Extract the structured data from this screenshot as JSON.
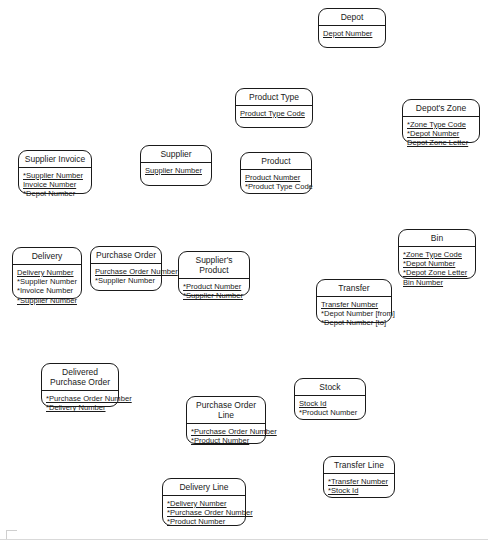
{
  "diagram": {
    "type": "entity-relationship-diagram",
    "width": 488,
    "height": 540,
    "notation": "Barker ERD: underline = primary key component, asterisk = foreign key",
    "entities": [
      {
        "id": "depot",
        "name": "Depot",
        "x": 318,
        "y": 8,
        "w": 68,
        "h": 40,
        "attributes": [
          {
            "text": "Depot Number",
            "pk": true,
            "fk": false
          }
        ]
      },
      {
        "id": "product-type",
        "name": "Product Type",
        "x": 235,
        "y": 88,
        "w": 78,
        "h": 40,
        "attributes": [
          {
            "text": "Product Type Code",
            "pk": true,
            "fk": false
          }
        ]
      },
      {
        "id": "depots-zone",
        "name": "Depot's Zone",
        "x": 402,
        "y": 99,
        "w": 78,
        "h": 44,
        "attributes": [
          {
            "text": "*Zone Type Code",
            "pk": true,
            "fk": true
          },
          {
            "text": "*Depot Number",
            "pk": true,
            "fk": true
          },
          {
            "text": "Depot Zone Letter",
            "pk": true,
            "fk": false
          }
        ]
      },
      {
        "id": "supplier-invoice",
        "name": "Supplier Invoice",
        "x": 18,
        "y": 150,
        "w": 74,
        "h": 44,
        "attributes": [
          {
            "text": "*Supplier Number",
            "pk": true,
            "fk": true
          },
          {
            "text": "Invoice Number",
            "pk": true,
            "fk": false
          },
          {
            "text": "*Depot Number",
            "pk": false,
            "fk": true
          }
        ]
      },
      {
        "id": "supplier",
        "name": "Supplier",
        "x": 140,
        "y": 145,
        "w": 72,
        "h": 41,
        "attributes": [
          {
            "text": "Supplier Number",
            "pk": true,
            "fk": false
          }
        ]
      },
      {
        "id": "product",
        "name": "Product",
        "x": 240,
        "y": 152,
        "w": 72,
        "h": 42,
        "attributes": [
          {
            "text": "Product Number",
            "pk": true,
            "fk": false
          },
          {
            "text": "*Product Type Code",
            "pk": false,
            "fk": true
          }
        ]
      },
      {
        "id": "bin",
        "name": "Bin",
        "x": 398,
        "y": 229,
        "w": 78,
        "h": 50,
        "attributes": [
          {
            "text": "*Zone Type Code",
            "pk": true,
            "fk": true
          },
          {
            "text": "*Depot Number",
            "pk": true,
            "fk": true
          },
          {
            "text": "*Depot Zone Letter",
            "pk": true,
            "fk": true
          },
          {
            "text": "Bin Number",
            "pk": true,
            "fk": false
          }
        ]
      },
      {
        "id": "delivery",
        "name": "Delivery",
        "x": 12,
        "y": 247,
        "w": 70,
        "h": 52,
        "attributes": [
          {
            "text": "Delivery Number",
            "pk": true,
            "fk": false
          },
          {
            "text": "*Supplier Number",
            "pk": false,
            "fk": true
          },
          {
            "text": "*Invoice Number",
            "pk": false,
            "fk": true
          },
          {
            "text": "*Supplier Number",
            "pk": true,
            "fk": true
          }
        ]
      },
      {
        "id": "purchase-order",
        "name": "Purchase Order",
        "x": 90,
        "y": 246,
        "w": 72,
        "h": 45,
        "attributes": [
          {
            "text": "Purchase Order Number",
            "pk": true,
            "fk": false
          },
          {
            "text": "*Supplier Number",
            "pk": false,
            "fk": true
          }
        ]
      },
      {
        "id": "suppliers-product",
        "name": "Supplier's Product",
        "x": 178,
        "y": 251,
        "w": 72,
        "h": 45,
        "attributes": [
          {
            "text": "*Product Number",
            "pk": true,
            "fk": true
          },
          {
            "text": "*Supplier Number",
            "pk": true,
            "fk": true
          }
        ]
      },
      {
        "id": "transfer",
        "name": "Transfer",
        "x": 316,
        "y": 279,
        "w": 76,
        "h": 44,
        "attributes": [
          {
            "text": "Transfer Number",
            "pk": true,
            "fk": false
          },
          {
            "text": "*Depot Number [from]",
            "pk": false,
            "fk": true
          },
          {
            "text": "*Depot Number [to]",
            "pk": false,
            "fk": true
          }
        ]
      },
      {
        "id": "delivered-purchase-order",
        "name": "Delivered\nPurchase Order",
        "x": 41,
        "y": 363,
        "w": 78,
        "h": 44,
        "attributes": [
          {
            "text": "*Purchase Order Number",
            "pk": true,
            "fk": true
          },
          {
            "text": "*Delivery Number",
            "pk": true,
            "fk": true
          }
        ]
      },
      {
        "id": "stock",
        "name": "Stock",
        "x": 294,
        "y": 378,
        "w": 72,
        "h": 42,
        "attributes": [
          {
            "text": "Stock Id",
            "pk": true,
            "fk": false
          },
          {
            "text": "*Product Number",
            "pk": false,
            "fk": true
          }
        ]
      },
      {
        "id": "purchase-order-line",
        "name": "Purchase Order\nLine",
        "x": 186,
        "y": 396,
        "w": 80,
        "h": 48,
        "attributes": [
          {
            "text": "*Purchase Order Number",
            "pk": true,
            "fk": true
          },
          {
            "text": "*Product Number",
            "pk": true,
            "fk": true
          }
        ]
      },
      {
        "id": "transfer-line",
        "name": "Transfer Line",
        "x": 323,
        "y": 456,
        "w": 72,
        "h": 42,
        "attributes": [
          {
            "text": "*Transfer Number",
            "pk": true,
            "fk": true
          },
          {
            "text": "*Stock Id",
            "pk": true,
            "fk": true
          }
        ]
      },
      {
        "id": "delivery-line",
        "name": "Delivery Line",
        "x": 162,
        "y": 478,
        "w": 84,
        "h": 48,
        "attributes": [
          {
            "text": "*Delivery Number",
            "pk": true,
            "fk": true
          },
          {
            "text": "*Purchase Order Number",
            "pk": true,
            "fk": true
          },
          {
            "text": "*Product Number",
            "pk": true,
            "fk": true
          }
        ]
      }
    ]
  }
}
